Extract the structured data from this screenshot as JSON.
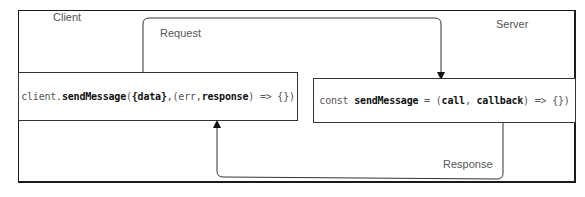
{
  "diagram": {
    "type": "sequence-flow",
    "nodes": {
      "client": {
        "region_label": "Client",
        "code": {
          "prefix": "client.",
          "method": "sendMessage",
          "open": "(",
          "arg1": "{data}",
          "sep": ",(err,",
          "arg2": "response",
          "suffix": ") => {})"
        }
      },
      "server": {
        "region_label": "Server",
        "code": {
          "keyword": "const ",
          "method": "sendMessage",
          "eq": " = (",
          "arg1": "call",
          "sep": ", ",
          "arg2": "callback",
          "suffix": ") => {})"
        }
      }
    },
    "edges": [
      {
        "from": "client",
        "to": "server",
        "label": "Request"
      },
      {
        "from": "server",
        "to": "client",
        "label": "Response"
      }
    ],
    "colors": {
      "border": "#1a1a1a",
      "line": "#333333",
      "label_text": "#555555",
      "code_bold": "#111111",
      "background": "#ffffff"
    }
  }
}
